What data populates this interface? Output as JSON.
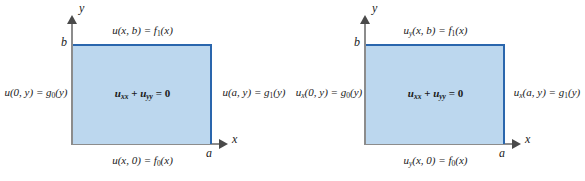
{
  "figure": {
    "type": "diagram",
    "colors": {
      "domain_fill": "#bcd7ee",
      "domain_border": "#2a66ad",
      "axis": "#8c8c8c",
      "text": "#1a1a1a",
      "background": "#ffffff"
    }
  },
  "panels": [
    {
      "id": "dirichlet-problem",
      "axes": {
        "x_label": "x",
        "y_label": "y",
        "x_tick_label": "a",
        "y_tick_label": "b"
      },
      "interior_equation": {
        "u1": "u",
        "sub1": "xx",
        "plus": " + ",
        "u2": "u",
        "sub2": "yy",
        "rhs": " = 0"
      },
      "boundary_top": {
        "fn": "u",
        "fsub": "",
        "args": "(x, b) = ",
        "rhs": "f",
        "rsub": "1",
        "rargs": "(x)"
      },
      "boundary_bottom": {
        "fn": "u",
        "fsub": "",
        "args": "(x, 0) = ",
        "rhs": "f",
        "rsub": "0",
        "rargs": "(x)"
      },
      "boundary_left": {
        "fn": "u",
        "fsub": "",
        "args": "(0, y) = ",
        "rhs": "g",
        "rsub": "0",
        "rargs": "(y)"
      },
      "boundary_right": {
        "fn": "u",
        "fsub": "",
        "args": "(a, y) = ",
        "rhs": "g",
        "rsub": "1",
        "rargs": "(y)"
      }
    },
    {
      "id": "neumann-problem",
      "axes": {
        "x_label": "x",
        "y_label": "y",
        "x_tick_label": "a",
        "y_tick_label": "b"
      },
      "interior_equation": {
        "u1": "u",
        "sub1": "xx",
        "plus": " + ",
        "u2": "u",
        "sub2": "yy",
        "rhs": " = 0"
      },
      "boundary_top": {
        "fn": "u",
        "fsub": "y",
        "args": "(x, b) = ",
        "rhs": "f",
        "rsub": "1",
        "rargs": "(x)"
      },
      "boundary_bottom": {
        "fn": "u",
        "fsub": "y",
        "args": "(x, 0) = ",
        "rhs": "f",
        "rsub": "0",
        "rargs": "(x)"
      },
      "boundary_left": {
        "fn": "u",
        "fsub": "x",
        "args": "(0, y) = ",
        "rhs": "g",
        "rsub": "0",
        "rargs": "(y)"
      },
      "boundary_right": {
        "fn": "u",
        "fsub": "x",
        "args": "(a, y) = ",
        "rhs": "g",
        "rsub": "1",
        "rargs": "(y)"
      }
    }
  ]
}
